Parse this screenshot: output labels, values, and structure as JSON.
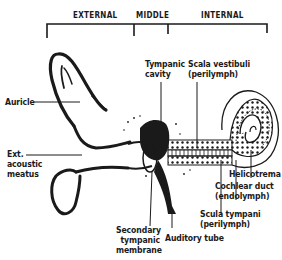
{
  "diagram": {
    "sections": [
      {
        "label": "EXTERNAL"
      },
      {
        "label": "MIDDLE"
      },
      {
        "label": "INTERNAL"
      }
    ],
    "labels": {
      "auricle": "Auricle",
      "ext_meatus_1": "Ext.",
      "ext_meatus_2": "acoustic",
      "ext_meatus_3": "meatus",
      "tympanic_1": "Tympanic",
      "tympanic_2": "cavity",
      "scala_vest_1": "Scala vestibuli",
      "scala_vest_2": "(perilymph)",
      "helicotrema": "Helicotrema",
      "cochlear_1": "Cochlear duct",
      "cochlear_2": "(endolymph)",
      "scala_tymp_1": "Scula tympani",
      "scala_tymp_2": "(perilymph)",
      "secondary_1": "Secondary",
      "secondary_2": "tympanic",
      "secondary_3": "membrane",
      "auditory": "Auditory tube"
    },
    "colors": {
      "ink": "#1a1a1a",
      "paper": "#ffffff"
    }
  }
}
